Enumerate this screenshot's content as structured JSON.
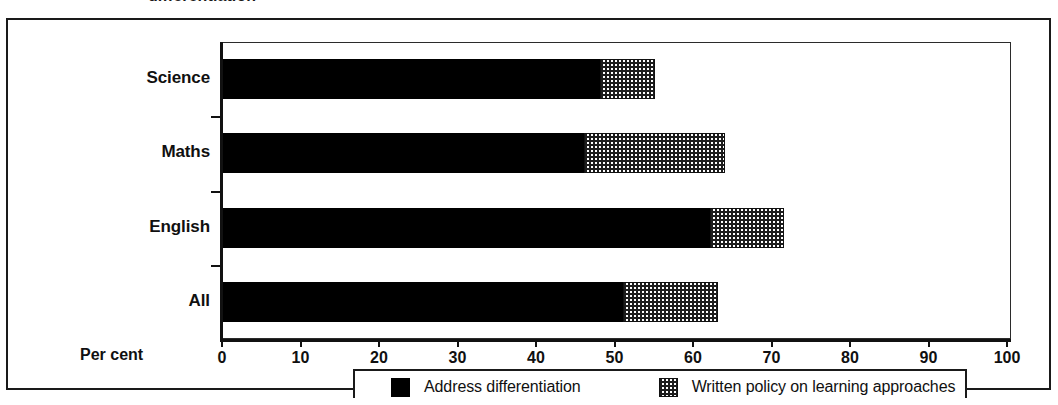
{
  "caption": {
    "text": "differentiation"
  },
  "chart_data": {
    "type": "bar",
    "orientation": "horizontal",
    "stacked": true,
    "title": "",
    "subtitle": "",
    "xlabel": "Per cent",
    "ylabel": "",
    "xlim": [
      0,
      100
    ],
    "xticks": [
      0,
      10,
      20,
      30,
      40,
      50,
      60,
      70,
      80,
      90,
      100
    ],
    "xtick_labels": [
      "0",
      "10",
      "20",
      "30",
      "40",
      "50",
      "60",
      "70",
      "80",
      "90",
      "100"
    ],
    "grid": false,
    "legend_position": "bottom",
    "categories": [
      "Science",
      "Maths",
      "English",
      "All"
    ],
    "series": [
      {
        "name": "Address differentiation",
        "pattern": "solid-black",
        "color": "#000000",
        "values": [
          48,
          46,
          62,
          51
        ]
      },
      {
        "name": "Written policy on learning approaches",
        "pattern": "checker-hatch",
        "color": "#1d1d1d",
        "values": [
          7,
          18,
          9.5,
          12
        ]
      }
    ],
    "cumulative_totals": [
      55,
      64,
      71.5,
      63
    ]
  },
  "axis": {
    "percent_label": "Per cent"
  },
  "legend": {
    "items": [
      {
        "label": "Address differentiation",
        "swatch": "solid-black-swatch"
      },
      {
        "label": "Written policy on learning approaches",
        "swatch": "hatch-swatch"
      }
    ]
  }
}
